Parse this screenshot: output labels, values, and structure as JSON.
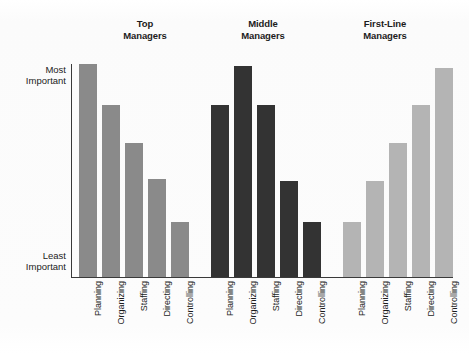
{
  "chart_data": {
    "type": "bar",
    "title": "",
    "subtitle": "",
    "xlabel": "",
    "ylabel": "",
    "ylim": [
      0,
      100
    ],
    "grid": false,
    "legend_position": "none",
    "y_tick_labels": [
      "Most\nImportant",
      "Least\nImportant"
    ],
    "y_tick_values": [
      100,
      4
    ],
    "categories": [
      "Planning",
      "Organizing",
      "Staffing",
      "Directing",
      "Controlling"
    ],
    "groups": [
      {
        "name": "Top\nManagers",
        "color": "#8a8a8a",
        "values": [
          100,
          81,
          63,
          46,
          26
        ]
      },
      {
        "name": "Middle\nManagers",
        "color": "#333333",
        "values": [
          81,
          99,
          81,
          45,
          26
        ]
      },
      {
        "name": "First-Line\nManagers",
        "color": "#b4b4b4",
        "values": [
          26,
          45,
          63,
          81,
          98
        ]
      }
    ],
    "series": [
      {
        "name": "Top Managers",
        "values": [
          100,
          81,
          63,
          46,
          26
        ]
      },
      {
        "name": "Middle Managers",
        "values": [
          81,
          99,
          81,
          45,
          26
        ]
      },
      {
        "name": "First-Line Managers",
        "values": [
          26,
          45,
          63,
          81,
          98
        ]
      }
    ],
    "axis_color": "#3a3a3a",
    "background_color": "#fdfdfd"
  }
}
